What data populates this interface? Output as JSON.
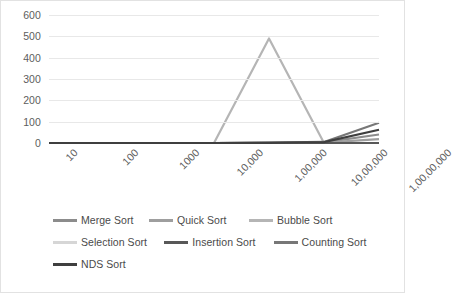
{
  "chart_data": {
    "type": "line",
    "title": "",
    "xlabel": "",
    "ylabel": "",
    "ylim": [
      0,
      600
    ],
    "yticks": [
      600,
      500,
      400,
      300,
      200,
      100,
      0
    ],
    "grid": true,
    "legend_position": "bottom",
    "categories": [
      "10",
      "100",
      "1000",
      "10,000",
      "1,00,000",
      "10,00,000",
      "1,00,00,000"
    ],
    "series": [
      {
        "name": "Merge Sort",
        "color": "#8c8c8c",
        "values": [
          0,
          0,
          0,
          0,
          1,
          3,
          40
        ]
      },
      {
        "name": "Quick Sort",
        "color": "#9e9e9e",
        "values": [
          0,
          0,
          0,
          0,
          1,
          2,
          18
        ]
      },
      {
        "name": "Bubble Sort",
        "color": "#b5b5b5",
        "values": [
          0,
          0,
          0,
          0,
          490,
          0,
          0
        ]
      },
      {
        "name": "Selection Sort",
        "color": "#d6d6d6",
        "values": [
          0,
          0,
          0,
          0,
          0,
          0,
          0
        ]
      },
      {
        "name": "Insertion Sort",
        "color": "#585858",
        "values": [
          0,
          0,
          0,
          0,
          0,
          0,
          0
        ]
      },
      {
        "name": "Counting Sort",
        "color": "#777777",
        "values": [
          0,
          0,
          0,
          0,
          2,
          5,
          95
        ]
      },
      {
        "name": "NDS Sort",
        "color": "#3f3f3f",
        "values": [
          0,
          0,
          0,
          0,
          1,
          4,
          62
        ]
      }
    ]
  },
  "legend": {
    "rows": [
      [
        {
          "label": "Merge Sort",
          "color": "#8c8c8c",
          "width": 96
        },
        {
          "label": "Quick Sort",
          "color": "#9e9e9e",
          "width": 100
        },
        {
          "label": "Bubble Sort",
          "color": "#b5b5b5",
          "width": 100
        }
      ],
      [
        {
          "label": "Selection Sort",
          "color": "#d6d6d6",
          "width": 112
        },
        {
          "label": "Insertion Sort",
          "color": "#585858",
          "width": 110
        },
        {
          "label": "Counting Sort",
          "color": "#777777",
          "width": 100
        }
      ],
      [
        {
          "label": "NDS Sort",
          "color": "#3f3f3f",
          "width": 96
        }
      ]
    ]
  }
}
